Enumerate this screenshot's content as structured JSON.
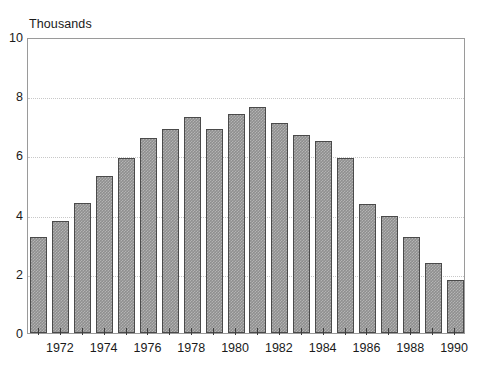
{
  "chart_data": {
    "type": "bar",
    "title": "",
    "subtitle": "",
    "unit_label": "Thousands",
    "xlabel": "",
    "ylabel": "Thousands",
    "ylim": [
      0,
      10
    ],
    "y_ticks": [
      0,
      2,
      4,
      6,
      8,
      10
    ],
    "y_tick_labels": [
      "0",
      "2",
      "4",
      "6",
      "8",
      "10"
    ],
    "gridlines": {
      "y": [
        2,
        4,
        6,
        8
      ],
      "style": "dotted",
      "x": false
    },
    "legend": null,
    "legend_position": "none",
    "annotations": [],
    "categories": [
      "1971",
      "1972",
      "1973",
      "1974",
      "1975",
      "1976",
      "1977",
      "1978",
      "1979",
      "1980",
      "1981",
      "1982",
      "1983",
      "1984",
      "1985",
      "1986",
      "1987",
      "1988",
      "1989",
      "1990"
    ],
    "x_tick_labels_shown": [
      "1972",
      "1974",
      "1976",
      "1978",
      "1980",
      "1982",
      "1984",
      "1986",
      "1988",
      "1990"
    ],
    "values": [
      3.25,
      3.8,
      4.4,
      5.3,
      5.9,
      6.6,
      6.9,
      7.3,
      6.9,
      7.4,
      7.65,
      7.1,
      6.7,
      6.5,
      5.9,
      4.35,
      3.95,
      3.25,
      2.35,
      1.8
    ],
    "bar_color": "#8f8f8f",
    "bar_border_color": "#4a4a4a",
    "frame_color": "#9a9a9a",
    "grid_color": "#c8c8c8",
    "text_color": "#1a1a1a"
  }
}
